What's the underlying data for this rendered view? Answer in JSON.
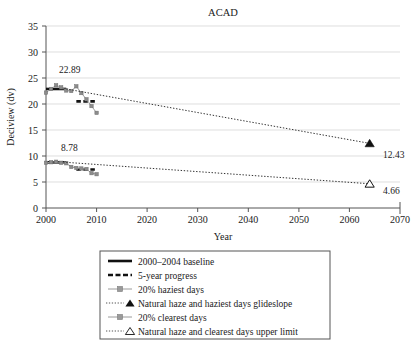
{
  "chart_data": {
    "type": "line",
    "title": "ACAD",
    "xlabel": "Year",
    "ylabel": "Deciview (dv)",
    "xlim": [
      2000,
      2070
    ],
    "ylim": [
      0,
      35
    ],
    "xticks": [
      2000,
      2010,
      2020,
      2030,
      2040,
      2050,
      2060,
      2070
    ],
    "yticks": [
      0,
      5,
      10,
      15,
      20,
      25,
      30,
      35
    ],
    "grid": "horizontal",
    "legend_position": "below-plot",
    "annotations": [
      {
        "text": "22.89",
        "x": 2002.5,
        "y": 24.6
      },
      {
        "text": "8.78",
        "x": 2003.0,
        "y": 10.3
      },
      {
        "text": "12.43",
        "x": 2065.5,
        "y": 11.9
      },
      {
        "text": "4.66",
        "x": 2065.5,
        "y": 4.0
      }
    ],
    "series": [
      {
        "name": "2000-2004 baseline",
        "style": "solid-black-thick",
        "x": [
          2000,
          2004
        ],
        "values": [
          22.89,
          22.89
        ]
      },
      {
        "name": "5-year progress",
        "style": "dashed-black-thick",
        "x": [
          2006,
          2010
        ],
        "values": [
          20.5,
          20.5
        ]
      },
      {
        "name": "20% haziest days",
        "style": "gray-line-with-markers",
        "x": [
          2000,
          2001,
          2002,
          2003,
          2004,
          2005,
          2006,
          2007,
          2008,
          2009,
          2010
        ],
        "values": [
          22.2,
          22.9,
          23.6,
          23.2,
          22.6,
          22.5,
          23.4,
          22.1,
          20.9,
          19.6,
          18.3
        ]
      },
      {
        "name": "Natural haze and haziest days glideslope",
        "style": "dotted-black-triangle-filled",
        "x": [
          2004,
          2064
        ],
        "values": [
          22.89,
          12.43
        ]
      },
      {
        "name": "2000-2004 baseline (clearest)",
        "style": "solid-black-thick",
        "x": [
          2000,
          2004
        ],
        "values": [
          8.78,
          8.78
        ]
      },
      {
        "name": "5-year progress (clearest)",
        "style": "dashed-black-thick",
        "x": [
          2006,
          2010
        ],
        "values": [
          7.4,
          7.4
        ]
      },
      {
        "name": "20% clearest days",
        "style": "gray-line-with-markers",
        "x": [
          2000,
          2001,
          2002,
          2003,
          2004,
          2005,
          2006,
          2007,
          2008,
          2009,
          2010
        ],
        "values": [
          8.7,
          8.8,
          8.9,
          8.7,
          8.6,
          7.9,
          7.7,
          7.6,
          7.5,
          6.7,
          6.5
        ]
      },
      {
        "name": "Natural haze and clearest days upper limit",
        "style": "dotted-black-triangle-open",
        "x": [
          2004,
          2064
        ],
        "values": [
          8.78,
          4.66
        ]
      }
    ]
  },
  "legend": {
    "items": [
      {
        "label": "2000–2004 baseline",
        "marker": "solid-thick-line"
      },
      {
        "label": "5-year progress",
        "marker": "dashed-thick-line"
      },
      {
        "label": "20% haziest days",
        "marker": "gray-line-square-marker"
      },
      {
        "label": "Natural haze and haziest days glideslope",
        "marker": "dotted-line-filled-triangle"
      },
      {
        "label": "20% clearest days",
        "marker": "gray-line-square-marker"
      },
      {
        "label": "Natural haze and clearest days upper limit",
        "marker": "dotted-line-open-triangle"
      }
    ]
  },
  "colors": {
    "series_gray": "#8c8c8c",
    "axis_black": "#1a1a1a",
    "grid_gray": "#d0d0d0",
    "background": "#ffffff"
  }
}
